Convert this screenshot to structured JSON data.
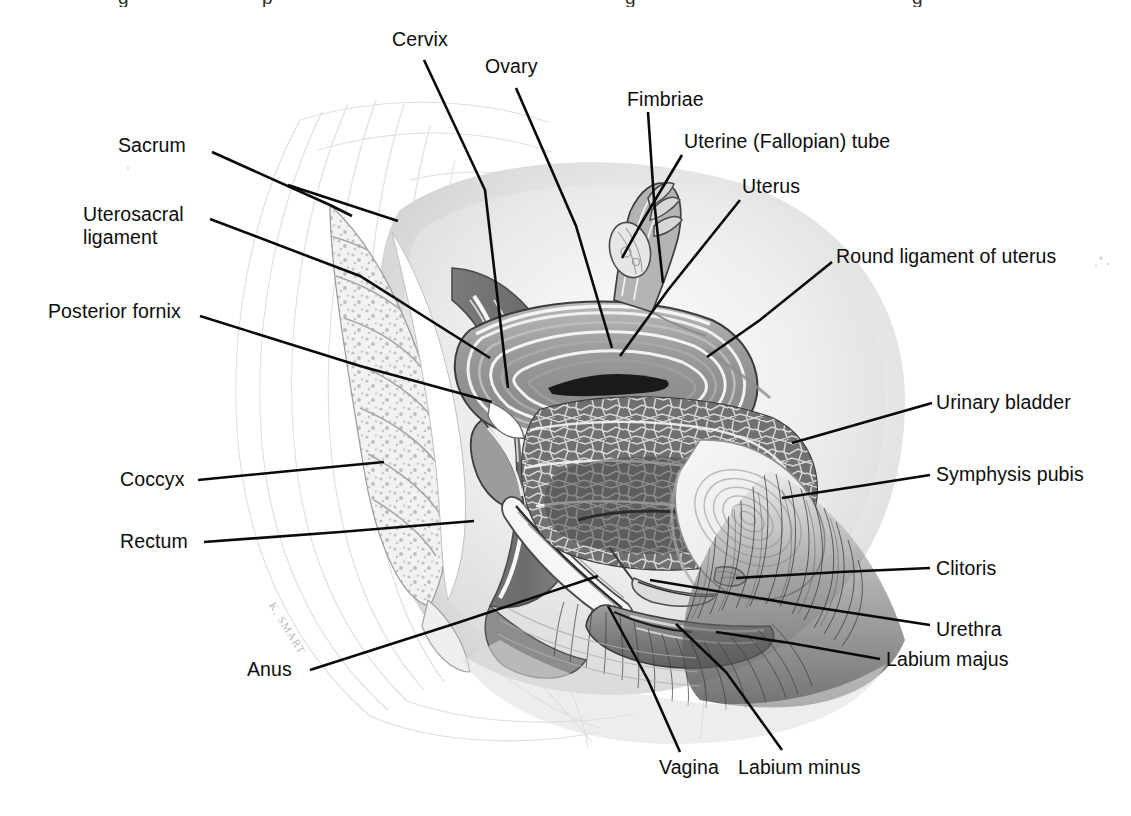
{
  "figure": {
    "artist_signature": "K. SMART",
    "background_color": "#ffffff",
    "ink_color": "#0a0a0a",
    "leader_line_width_px": 2.6,
    "label_font_size_px": 19.5,
    "width_px": 1131,
    "height_px": 816
  },
  "top_caption_fragment": {
    "note": "bottom descenders of a caption line cropped from the page above",
    "crumbs": [
      {
        "text": "g",
        "x": 118
      },
      {
        "text": "p",
        "x": 262
      },
      {
        "text": "g",
        "x": 625
      },
      {
        "text": "g",
        "x": 912
      }
    ]
  },
  "labels": [
    {
      "id": "cervix",
      "text": "Cervix",
      "side": "top",
      "x": 392,
      "y": 28,
      "leader": "M 424,60 L 485,190 L 508,388"
    },
    {
      "id": "ovary",
      "text": "Ovary",
      "side": "top",
      "x": 485,
      "y": 55,
      "leader": "M 516,88 L 576,226 L 612,348"
    },
    {
      "id": "fimbriae",
      "text": "Fimbriae",
      "side": "top",
      "x": 627,
      "y": 88,
      "leader": "M 648,112 L 654,200 L 663,283"
    },
    {
      "id": "uterine-fallopian-tube",
      "text": "Uterine (Fallopian) tube",
      "side": "right",
      "x": 684,
      "y": 130,
      "leader": "M 682,155 L 642,222 L 622,258"
    },
    {
      "id": "uterus",
      "text": "Uterus",
      "side": "right",
      "x": 742,
      "y": 175,
      "leader": "M 740,200 L 668,290 L 620,356"
    },
    {
      "id": "round-ligament-of-uterus",
      "text": "Round ligament of uterus",
      "side": "right",
      "x": 836,
      "y": 245,
      "leader": "M 832,262 L 760,320 L 707,357"
    },
    {
      "id": "sacrum",
      "text": "Sacrum",
      "side": "left",
      "x": 118,
      "y": 134,
      "leader": "M 212,152 L 330,205 L 352,216 M 288,185 L 398,221"
    },
    {
      "id": "uterosacral-ligament",
      "text": "Uterosacral\nligament",
      "side": "left",
      "x": 83,
      "y": 203,
      "leader": "M 210,219 L 360,276 L 490,358"
    },
    {
      "id": "posterior-fornix",
      "text": "Posterior fornix",
      "side": "left",
      "x": 48,
      "y": 300,
      "leader": "M 200,316 L 360,366 L 492,402"
    },
    {
      "id": "urinary-bladder",
      "text": "Urinary bladder",
      "side": "right",
      "x": 936,
      "y": 391,
      "leader": "M 932,403 L 862,423 L 792,443"
    },
    {
      "id": "coccyx",
      "text": "Coccyx",
      "side": "left",
      "x": 120,
      "y": 468,
      "leader": "M 198,480 L 300,470 L 384,462"
    },
    {
      "id": "symphysis-pubis",
      "text": "Symphysis pubis",
      "side": "right",
      "x": 936,
      "y": 463,
      "leader": "M 930,475 L 860,486 L 782,498"
    },
    {
      "id": "rectum",
      "text": "Rectum",
      "side": "left",
      "x": 120,
      "y": 530,
      "leader": "M 204,542 L 340,532 L 474,521"
    },
    {
      "id": "clitoris",
      "text": "Clitoris",
      "side": "right",
      "x": 936,
      "y": 557,
      "leader": "M 930,568 L 840,572 L 736,578"
    },
    {
      "id": "urethra",
      "text": "Urethra",
      "side": "right",
      "x": 936,
      "y": 618,
      "leader": "M 930,625 L 800,605 L 650,580"
    },
    {
      "id": "labium-majus",
      "text": "Labium majus",
      "side": "right",
      "x": 886,
      "y": 648,
      "leader": "M 880,659 L 790,643 L 716,632"
    },
    {
      "id": "anus",
      "text": "Anus",
      "side": "left",
      "x": 247,
      "y": 658,
      "leader": "M 310,670 L 460,622 L 598,576"
    },
    {
      "id": "vagina",
      "text": "Vagina",
      "side": "bottom",
      "x": 659,
      "y": 756,
      "leader": "M 680,752 L 648,680 L 608,606"
    },
    {
      "id": "labium-minus",
      "text": "Labium minus",
      "side": "bottom",
      "x": 738,
      "y": 756,
      "leader": "M 782,750 L 726,672 L 676,624"
    }
  ],
  "anatomy_regions": [
    {
      "id": "sacrum-coccyx",
      "name": "Sacrum and coccyx"
    },
    {
      "id": "rectum",
      "name": "Rectum"
    },
    {
      "id": "uterus-body",
      "name": "Uterus body"
    },
    {
      "id": "cervix",
      "name": "Cervix"
    },
    {
      "id": "ovary",
      "name": "Ovary"
    },
    {
      "id": "uterine-tube",
      "name": "Uterine (Fallopian) tube"
    },
    {
      "id": "fimbriae",
      "name": "Fimbriae"
    },
    {
      "id": "urinary-bladder",
      "name": "Urinary bladder"
    },
    {
      "id": "symphysis-pubis",
      "name": "Symphysis pubis"
    },
    {
      "id": "vagina",
      "name": "Vagina"
    },
    {
      "id": "urethra",
      "name": "Urethra"
    },
    {
      "id": "labia",
      "name": "Labium majus and minus"
    },
    {
      "id": "pubic-hair",
      "name": "Pubic hair"
    },
    {
      "id": "body-outline",
      "name": "Body surface outline"
    }
  ]
}
